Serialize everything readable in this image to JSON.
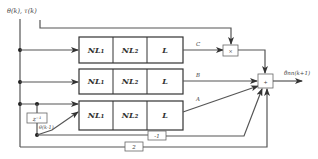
{
  "diagram": {
    "input_label": "θ(k), τ(k)",
    "output_label": "θ̂nn(k+1)",
    "rows": [
      {
        "blocks": [
          "NL₁",
          "NL₂",
          "L"
        ],
        "output_label": "C"
      },
      {
        "blocks": [
          "NL₁",
          "NL₂",
          "L"
        ],
        "output_label": "B"
      },
      {
        "blocks": [
          "NL₁",
          "NL₂",
          "L"
        ],
        "output_label": "A"
      }
    ],
    "multiply_symbol": "×",
    "sum_symbol": "+",
    "delay_label": "z⁻¹",
    "delayed_signal_label": "θ(k-1)",
    "gain_neg1": "-1",
    "gain_2": "2"
  },
  "colors": {
    "line": "#555555",
    "box_border": "#333333",
    "background": "#ffffff"
  }
}
